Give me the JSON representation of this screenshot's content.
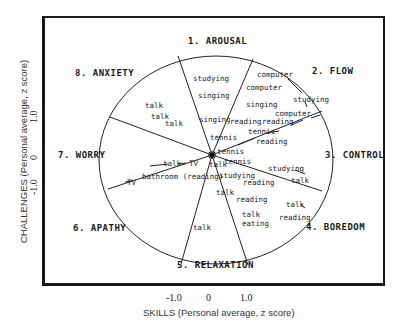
{
  "figure": {
    "x_axis": {
      "title": "SKILLS (Personal average, z score)",
      "ticks": [
        "-1.0",
        "0",
        "1.0"
      ]
    },
    "y_axis": {
      "title": "CHALLENGES (Personal average, z score)",
      "ticks": [
        "1.0",
        "0",
        "-1.0"
      ]
    },
    "regions": [
      {
        "label": "1. AROUSAL"
      },
      {
        "label": "2. FLOW"
      },
      {
        "label": "3. CONTROL"
      },
      {
        "label": "4. BOREDOM"
      },
      {
        "label": "5. RELAXATION"
      },
      {
        "label": "6. APATHY"
      },
      {
        "label": "7. WORRY"
      },
      {
        "label": "8. ANXIETY"
      }
    ],
    "activities": [
      {
        "text": "studying"
      },
      {
        "text": "singing"
      },
      {
        "text": "singing"
      },
      {
        "text": "computer"
      },
      {
        "text": "computer"
      },
      {
        "text": "singing"
      },
      {
        "text": "studying"
      },
      {
        "text": "computer"
      },
      {
        "text": "reading"
      },
      {
        "text": "reading"
      },
      {
        "text": "tennis"
      },
      {
        "text": "reading"
      },
      {
        "text": "tennis"
      },
      {
        "text": "tennis"
      },
      {
        "text": "tennis"
      },
      {
        "text": "studying"
      },
      {
        "text": "talk"
      },
      {
        "text": "studying"
      },
      {
        "text": "reading"
      },
      {
        "text": "talk"
      },
      {
        "text": "reading"
      },
      {
        "text": "talk"
      },
      {
        "text": "reading"
      },
      {
        "text": "talk"
      },
      {
        "text": "eating"
      },
      {
        "text": "talk"
      },
      {
        "text": "talk"
      },
      {
        "text": "talk"
      },
      {
        "text": "talk"
      },
      {
        "text": "talk"
      },
      {
        "text": "TV"
      },
      {
        "text": "talk"
      },
      {
        "text": "TV"
      },
      {
        "text": "bathroom (reading)"
      }
    ]
  }
}
